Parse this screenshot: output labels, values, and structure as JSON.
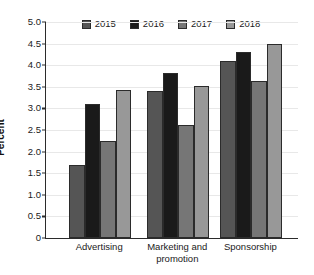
{
  "chart_data": {
    "type": "bar",
    "title": "",
    "subtitle": "",
    "xlabel": "",
    "ylabel": "Percent",
    "categories": [
      "Advertising",
      "Marketing and promotion",
      "Sponsorship"
    ],
    "series": [
      {
        "name": "2015",
        "color": "#555555",
        "values": [
          1.7,
          3.41,
          4.1
        ]
      },
      {
        "name": "2016",
        "color": "#1a1a1a",
        "values": [
          3.11,
          3.82,
          4.31
        ]
      },
      {
        "name": "2017",
        "color": "#767676",
        "values": [
          2.24,
          2.62,
          3.63
        ]
      },
      {
        "name": "2018",
        "color": "#989898",
        "values": [
          3.42,
          3.51,
          4.49
        ]
      }
    ],
    "ylim": [
      0,
      5.0
    ],
    "ytick_values": [
      0,
      0.5,
      1.0,
      1.5,
      2.0,
      2.5,
      3.0,
      3.5,
      4.0,
      4.5,
      5.0
    ],
    "ytick_labels": [
      "0",
      "0.5",
      "1.0",
      "1.5",
      "2.0",
      "2.5",
      "3.0",
      "3.5",
      "4.0",
      "4.5",
      "5.0"
    ],
    "grid": true,
    "legend_position": "top-center",
    "bar_edge_color": "#2b2b2b",
    "axis_color": "#2b2b2b",
    "gridline_color": "#e8e8e8",
    "background_color": "#ffffff"
  },
  "axis": {
    "y_title": "Percent"
  },
  "legend": {
    "entries": [
      "2015",
      "2016",
      "2017",
      "2018"
    ]
  },
  "xaxis": {
    "labels": [
      {
        "line1": "Advertising",
        "line2": ""
      },
      {
        "line1": "Marketing and",
        "line2": "promotion"
      },
      {
        "line1": "Sponsorship",
        "line2": ""
      }
    ]
  }
}
